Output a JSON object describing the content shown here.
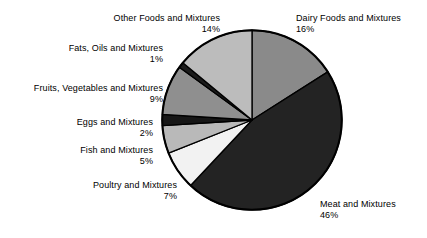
{
  "chart_data": {
    "type": "pie",
    "title": "",
    "subtitle": "",
    "xlabel": "",
    "ylabel": "",
    "legend_position": "none",
    "grid": false,
    "units": "percent",
    "start_angle_deg": 0,
    "direction": "clockwise",
    "categories": [
      "Dairy Foods and Mixtures",
      "Meat and Mixtures",
      "Poultry and Mixtures",
      "Fish and Mixtures",
      "Eggs and Mixtures",
      "Fruits, Vegetables and Mixtures",
      "Fats, Oils and Mixtures",
      "Other Foods and Mixtures"
    ],
    "values": [
      16,
      46,
      7,
      5,
      2,
      9,
      1,
      14
    ],
    "value_labels": [
      "16%",
      "46%",
      "7%",
      "5%",
      "2%",
      "9%",
      "1%",
      "14%"
    ],
    "colors": [
      "#8a8a8a",
      "#232323",
      "#f2f2f2",
      "#b9b9b9",
      "#161616",
      "#8f8f8f",
      "#1b1b1b",
      "#bcbcbc"
    ],
    "slice_border_color": "#000000",
    "slices": [
      {
        "label": "Dairy Foods and Mixtures",
        "value": 16,
        "pct_text": "16%",
        "color": "#8a8a8a"
      },
      {
        "label": "Meat and Mixtures",
        "value": 46,
        "pct_text": "46%",
        "color": "#232323"
      },
      {
        "label": "Poultry and Mixtures",
        "value": 7,
        "pct_text": "7%",
        "color": "#f2f2f2"
      },
      {
        "label": "Fish and Mixtures",
        "value": 5,
        "pct_text": "5%",
        "color": "#b9b9b9"
      },
      {
        "label": "Eggs and Mixtures",
        "value": 2,
        "pct_text": "2%",
        "color": "#161616"
      },
      {
        "label": "Fruits, Vegetables and Mixtures",
        "value": 9,
        "pct_text": "9%",
        "color": "#8f8f8f"
      },
      {
        "label": "Fats, Oils and Mixtures",
        "value": 1,
        "pct_text": "1%",
        "color": "#1b1b1b"
      },
      {
        "label": "Other Foods and Mixtures",
        "value": 14,
        "pct_text": "14%",
        "color": "#bcbcbc"
      }
    ]
  }
}
